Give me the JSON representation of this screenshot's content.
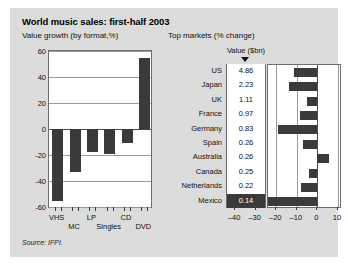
{
  "card": {
    "title": "World music sales: first-half 2003",
    "subtitle_left": "Value growth (by format,%)",
    "subtitle_right": "Top markets (% change)",
    "source": "Source: IFPI.",
    "background": "#dcdcdc",
    "bar_color": "#3a3a3a",
    "panel_color": "#ffffff"
  },
  "right_table": {
    "value_header": "Value ($bn)",
    "sort_marker": "triangle-down-icon"
  },
  "chart_data": [
    {
      "type": "bar",
      "title": "Value growth (by format,%)",
      "xlabel": "",
      "ylabel": "",
      "ylim": [
        -60,
        60
      ],
      "yticks": [
        -60,
        -40,
        -20,
        0,
        20,
        40,
        60
      ],
      "grid": true,
      "orientation": "vertical",
      "categories": [
        "VHS",
        "MC",
        "LP",
        "Singles",
        "CD",
        "DVD"
      ],
      "values": [
        -55,
        -33,
        -18,
        -19,
        -11,
        55
      ]
    },
    {
      "type": "bar",
      "title": "Top markets (% change)",
      "xlabel": "",
      "ylabel": "",
      "xlim": [
        -24,
        11
      ],
      "xticks": [
        -40,
        -30,
        -20,
        -10,
        0,
        10
      ],
      "grid": true,
      "orientation": "horizontal",
      "highlight": "Mexico",
      "categories": [
        "US",
        "Japan",
        "UK",
        "France",
        "Germany",
        "Spain",
        "Australia",
        "Canada",
        "Netherlands",
        "Mexico"
      ],
      "values": [
        -11.5,
        -14.0,
        -5.0,
        -8.5,
        -19.0,
        -7.0,
        5.5,
        -4.0,
        -8.0,
        -45.0
      ],
      "value_label_header": "Value ($bn)",
      "value_labels": [
        "4.86",
        "2.23",
        "1.11",
        "0.97",
        "0.83",
        "0.26",
        "0.26",
        "0.25",
        "0.22",
        "0.14"
      ]
    }
  ]
}
